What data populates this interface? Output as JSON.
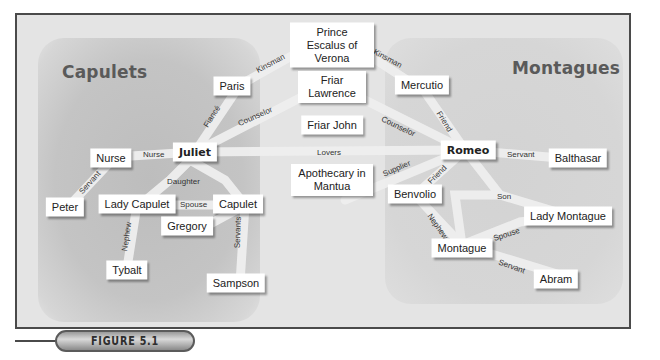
{
  "groups": {
    "capulets": {
      "label": "Capulets"
    },
    "montagues": {
      "label": "Montagues"
    }
  },
  "nodes": {
    "prince": {
      "label": "Prince Escalus of Verona"
    },
    "paris": {
      "label": "Paris"
    },
    "friar_lawrence": {
      "label": "Friar Lawrence"
    },
    "mercutio": {
      "label": "Mercutio"
    },
    "friar_john": {
      "label": "Friar John"
    },
    "nurse": {
      "label": "Nurse"
    },
    "juliet": {
      "label": "Juliet"
    },
    "romeo": {
      "label": "Romeo"
    },
    "balthasar": {
      "label": "Balthasar"
    },
    "peter": {
      "label": "Peter"
    },
    "lady_capulet": {
      "label": "Lady Capulet"
    },
    "capulet": {
      "label": "Capulet"
    },
    "apothecary": {
      "label": "Apothecary in Mantua"
    },
    "benvolio": {
      "label": "Benvolio"
    },
    "lady_montague": {
      "label": "Lady Montague"
    },
    "gregory": {
      "label": "Gregory"
    },
    "tybalt": {
      "label": "Tybalt"
    },
    "sampson": {
      "label": "Sampson"
    },
    "montague": {
      "label": "Montague"
    },
    "abram": {
      "label": "Abram"
    }
  },
  "edges": [
    {
      "from": "paris",
      "to": "prince",
      "label": "Kinsman"
    },
    {
      "from": "prince",
      "to": "mercutio",
      "label": "Kinsman"
    },
    {
      "from": "juliet",
      "to": "paris",
      "label": "Fiancé"
    },
    {
      "from": "juliet",
      "to": "friar_lawrence",
      "label": "Counselor"
    },
    {
      "from": "friar_lawrence",
      "to": "romeo",
      "label": "Counselor"
    },
    {
      "from": "mercutio",
      "to": "romeo",
      "label": "Friend"
    },
    {
      "from": "nurse",
      "to": "juliet",
      "label": "Nurse"
    },
    {
      "from": "juliet",
      "to": "romeo",
      "label": "Lovers"
    },
    {
      "from": "romeo",
      "to": "balthasar",
      "label": "Servant"
    },
    {
      "from": "nurse",
      "to": "peter",
      "label": "Servant"
    },
    {
      "from": "juliet",
      "to": "capulet",
      "label": "Daughter"
    },
    {
      "from": "lady_capulet",
      "to": "capulet",
      "label": "Spouse"
    },
    {
      "from": "apothecary",
      "to": "romeo",
      "label": "Supplier"
    },
    {
      "from": "benvolio",
      "to": "romeo",
      "label": "Friend"
    },
    {
      "from": "romeo",
      "to": "montague",
      "label": "Son"
    },
    {
      "from": "lady_capulet",
      "to": "tybalt",
      "label": "Nephew"
    },
    {
      "from": "capulet",
      "to": "gregory",
      "label": "Servants"
    },
    {
      "from": "benvolio",
      "to": "montague",
      "label": "Nephew"
    },
    {
      "from": "montague",
      "to": "lady_montague",
      "label": "Spouse"
    },
    {
      "from": "montague",
      "to": "abram",
      "label": "Servant"
    }
  ],
  "figure": {
    "label": "FIGURE 5.1"
  },
  "colors": {
    "frame_border": "#4a4a4a",
    "background": "#e4e4e4",
    "capulet_region": "#c2c2c2",
    "montague_region": "#d5d5d5",
    "edge_band": "#eeeeee",
    "node_fill": "#ffffff"
  }
}
